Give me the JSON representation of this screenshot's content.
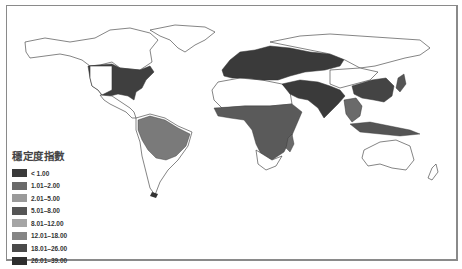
{
  "legend": {
    "title": "穩定度指數",
    "items": [
      {
        "label": "< 1.00",
        "color": "#3a3a3a"
      },
      {
        "label": "1.01–2.00",
        "color": "#6a6a6a"
      },
      {
        "label": "2.01–5.00",
        "color": "#9a9a9a"
      },
      {
        "label": "5.01–8.00",
        "color": "#555555"
      },
      {
        "label": "8.01–12.00",
        "color": "#a5a5a5"
      },
      {
        "label": "12.01–18.00",
        "color": "#858585"
      },
      {
        "label": "18.01–26.00",
        "color": "#4a4a4a"
      },
      {
        "label": "26.01–39.00",
        "color": "#2e2e2e"
      }
    ]
  },
  "map": {
    "regions": [
      {
        "name": "united-states",
        "color": "#3f3f3f"
      },
      {
        "name": "europe-russia",
        "color": "#3a3a3a"
      },
      {
        "name": "sub-saharan-africa",
        "color": "#5a5a5a"
      },
      {
        "name": "south-america-amazon",
        "color": "#7a7a7a"
      },
      {
        "name": "south-asia",
        "color": "#3a3a3a"
      },
      {
        "name": "east-asia-china",
        "color": "#444444"
      },
      {
        "name": "southeast-asia",
        "color": "#6a6a6a"
      }
    ]
  }
}
